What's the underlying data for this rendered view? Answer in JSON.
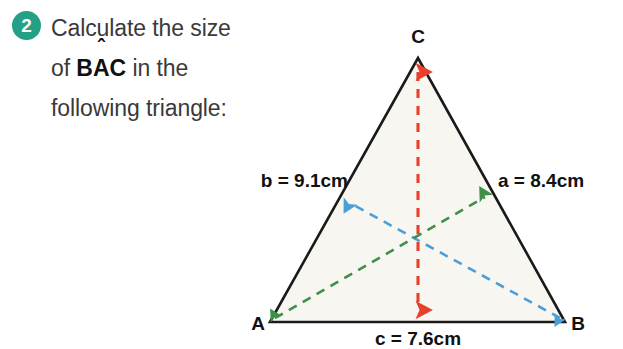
{
  "question": {
    "number": "2",
    "line1": "Calculate the size",
    "line2_prefix": "of ",
    "line2_term_b": "B",
    "line2_term_a": "A",
    "line2_hat": "ˆ",
    "line2_term_c": "C",
    "line2_suffix": " in the",
    "line3": "following triangle:"
  },
  "figure": {
    "vertices": {
      "a": "A",
      "b": "B",
      "c": "C"
    },
    "labels": {
      "side_b": "b  = 9.1cm",
      "side_a": "a = 8.4cm",
      "side_c": "c = 7.6cm"
    },
    "colors": {
      "badge": "#23a085",
      "outline": "#1a1a1a",
      "fill": "#f8f6f1",
      "height_arrow": "#e8402a",
      "arrow_blue": "#4b9ed6",
      "arrow_green": "#3f8f4a",
      "text": "#111111"
    }
  }
}
